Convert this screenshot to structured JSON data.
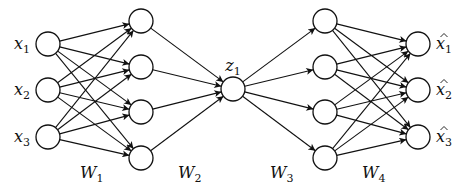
{
  "diagram": {
    "colors": {
      "stroke": "#111111",
      "fill": "#ffffff",
      "background": "#ffffff"
    },
    "node_radius": 12,
    "layers": [
      {
        "name": "input",
        "x": 48,
        "ys": [
          44,
          90,
          137
        ],
        "labels": [
          "x",
          "x",
          "x"
        ],
        "subscripts": [
          "1",
          "2",
          "3"
        ],
        "label_side": "left",
        "hat": false
      },
      {
        "name": "hidden1",
        "x": 141,
        "ys": [
          21,
          67,
          112,
          158
        ],
        "labels": [],
        "subscripts": []
      },
      {
        "name": "code",
        "x": 233,
        "ys": [
          89
        ],
        "labels": [
          "z"
        ],
        "subscripts": [
          "1"
        ],
        "label_side": "top",
        "hat": false
      },
      {
        "name": "hidden3",
        "x": 325,
        "ys": [
          21,
          67,
          112,
          158
        ],
        "labels": [],
        "subscripts": []
      },
      {
        "name": "output",
        "x": 418,
        "ys": [
          44,
          90,
          137
        ],
        "labels": [
          "x",
          "x",
          "x"
        ],
        "subscripts": [
          "1",
          "2",
          "3"
        ],
        "label_side": "right",
        "hat": true
      }
    ],
    "weights": [
      {
        "label": "W",
        "sub": "1",
        "x": 80,
        "y": 178
      },
      {
        "label": "W",
        "sub": "2",
        "x": 178,
        "y": 178
      },
      {
        "label": "W",
        "sub": "3",
        "x": 270,
        "y": 178
      },
      {
        "label": "W",
        "sub": "4",
        "x": 362,
        "y": 178
      }
    ]
  }
}
